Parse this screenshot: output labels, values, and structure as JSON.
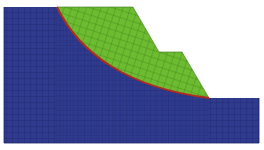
{
  "figure": {
    "colors": {
      "background": "#ffffff",
      "stable_soil": "#2e3a8c",
      "sliding_mass": "#66b32e",
      "slip_surface": "#b02a1e",
      "mesh_line_dark": "#1a2266",
      "mesh_line_green": "#3f7a1a"
    },
    "regions": [
      {
        "name": "stable-soil-domain",
        "color_key": "stable_soil"
      },
      {
        "name": "sliding-mass",
        "color_key": "sliding_mass"
      },
      {
        "name": "slip-surface",
        "color_key": "slip_surface"
      }
    ]
  }
}
